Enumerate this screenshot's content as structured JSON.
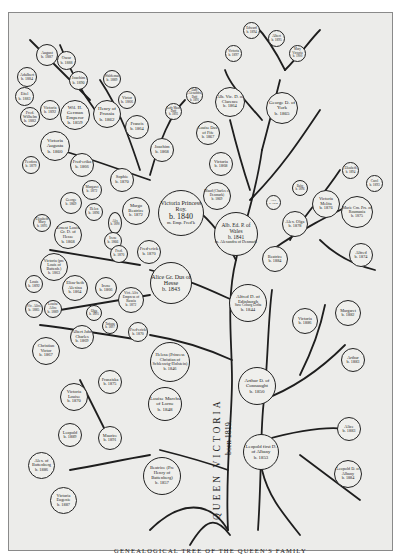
{
  "title": "Genealogical Tree of the Queen's Family",
  "caption": "GENEALOGICAL TREE OF THE QUEEN'S FAMILY",
  "trunk": {
    "line1": "QUEEN VICTORIA",
    "line2": "born 1819."
  },
  "colors": {
    "paper": "#ececea",
    "ink": "#1d1d1d",
    "border": "#8a8a8a"
  },
  "nodes": [
    {
      "id": "august",
      "name": "August",
      "birth": "b. 1887"
    },
    {
      "id": "oscar",
      "name": "Oscar",
      "birth": "b. 1888"
    },
    {
      "id": "adalbert",
      "name": "Adalbert",
      "birth": "b. 1884"
    },
    {
      "id": "joachim-small",
      "name": "Joachim",
      "birth": "b. 1890"
    },
    {
      "id": "eitel",
      "name": "Eitel",
      "birth": "b. 1883"
    },
    {
      "id": "fred-wilhelm",
      "name": "Fred. Wilhelm",
      "birth": "b. 1882"
    },
    {
      "id": "victoria-small",
      "name": "Victoria",
      "birth": "b. 1892"
    },
    {
      "id": "wilhelm",
      "name": "Wil. II. German Emperor",
      "birth": "b. 1859"
    },
    {
      "id": "waldemar",
      "name": "Waldemar",
      "birth": "b. 1889"
    },
    {
      "id": "henry",
      "name": "Henry of Prussia",
      "birth": "b. 1862"
    },
    {
      "id": "victor",
      "name": "Victor",
      "birth": "b. 1866"
    },
    {
      "id": "francis",
      "name": "Francis",
      "birth": "b. 1864"
    },
    {
      "id": "victoria-augusta",
      "name": "Victoria Augusta",
      "birth": "b. 1860"
    },
    {
      "id": "feodora",
      "name": "Feodora",
      "birth": "b. 1879"
    },
    {
      "id": "frederika",
      "name": "Fred-erika",
      "birth": "b. 1866"
    },
    {
      "id": "joachim",
      "name": "Joachim",
      "birth": "b. 1868"
    },
    {
      "id": "sophie",
      "name": "Sophie",
      "birth": "b. 1870"
    },
    {
      "id": "margaret-small",
      "name": "Margaret",
      "birth": "b. 1872"
    },
    {
      "id": "george-small",
      "name": "George",
      "birth": "b. 1869"
    },
    {
      "id": "helen",
      "name": "Helen",
      "birth": "b. 1896"
    },
    {
      "id": "margo-beatrice",
      "name": "Margo Beatrice",
      "birth": "b. 1872"
    },
    {
      "id": "victoria-princess-royal",
      "name": "Victoria Princess Roy.",
      "birth": "b. 1840",
      "note": "m. Emp. Fred'k"
    },
    {
      "id": "alix-small",
      "name": "Alix",
      "birth": "b. 1890"
    },
    {
      "id": "elizabeth-mary",
      "name": "Elizabeth Mary",
      "birth": "b. 1895"
    },
    {
      "id": "ernest-louis",
      "name": "Ernest Louis",
      "birth": "b. 1868",
      "note": "Gr. D. of Hesse"
    },
    {
      "id": "irene-small",
      "name": "Irene",
      "birth": "b. 1866"
    },
    {
      "id": "fred-small",
      "name": "Fred.",
      "birth": "b. 1870"
    },
    {
      "id": "frederick",
      "name": "Fred-erick",
      "birth": "b. 1870"
    },
    {
      "id": "victoria-battenberg",
      "name": "Victoria (pre Louis of Battenb.)",
      "birth": "b. 1863"
    },
    {
      "id": "louis",
      "name": "Louis",
      "birth": "b. 1892"
    },
    {
      "id": "elizabeth",
      "name": "Eliza-beth Alexina",
      "birth": "b. 1864"
    },
    {
      "id": "irene",
      "name": "Irene",
      "birth": "b. 1866"
    },
    {
      "id": "alice",
      "name": "Alice Gr. Dus of Hesse",
      "birth": "b. 1843"
    },
    {
      "id": "vic-alice",
      "name": "Vic. Alice",
      "birth": "b. 1885"
    },
    {
      "id": "louise-alice",
      "name": "Louise Alice",
      "birth": "b. 1889"
    },
    {
      "id": "alix",
      "name": "Vict. Alix Empress of Russia",
      "birth": "b. 1872"
    },
    {
      "id": "olga",
      "name": "Olga",
      "birth": "b. 1895"
    },
    {
      "id": "tatiana",
      "name": "Tatiana",
      "birth": "b. 1897"
    },
    {
      "id": "albert-john",
      "name": "Albert John Charles",
      "birth": "b. 1869"
    },
    {
      "id": "frederick-2",
      "name": "Fred-erick",
      "birth": "b. 1870"
    },
    {
      "id": "christian-victor",
      "name": "Christian Victor",
      "birth": "b. 1867"
    },
    {
      "id": "helena",
      "name": "Helena (Princess Christian of Schleswig-Holstein)",
      "birth": "b. 1846"
    },
    {
      "id": "victoria-louise",
      "name": "Victoria Louise",
      "birth": "b. 1870"
    },
    {
      "id": "franziska",
      "name": "Franziska",
      "birth": "b. 1875"
    },
    {
      "id": "louise",
      "name": "Louise Marchs of Lorne",
      "birth": "b. 1848"
    },
    {
      "id": "leopold-b",
      "name": "Leopold",
      "birth": "b. 1889"
    },
    {
      "id": "maurice",
      "name": "Maurice",
      "birth": "b. 1891"
    },
    {
      "id": "alex-battenberg",
      "name": "Alex. of Battenberg",
      "birth": "b. 1886"
    },
    {
      "id": "beatrice",
      "name": "Beatrice (Pre Henry of Battenberg)",
      "birth": "b. 1857"
    },
    {
      "id": "victoria-eugenie",
      "name": "Victoria Eugenie",
      "birth": "b. 1887"
    },
    {
      "id": "edward",
      "name": "Edward",
      "birth": "b. 1894"
    },
    {
      "id": "albert",
      "name": "Albert",
      "birth": "b. 1895"
    },
    {
      "id": "mary-small",
      "name": "Victoria",
      "birth": "b. 1897"
    },
    {
      "id": "albert-victor-child",
      "name": "Mary Victoria",
      "birth": "b. 1900"
    },
    {
      "id": "alb-vic",
      "name": "Alb. Vic. D. of Clarence",
      "birth": "b. 1864"
    },
    {
      "id": "george",
      "name": "George D. of York",
      "birth": "b. 1865"
    },
    {
      "id": "lady-alexandra",
      "name": "Lady Alexandra Duff",
      "birth": "b. 1891"
    },
    {
      "id": "lady-maud",
      "name": "Lady Maud Duff",
      "birth": "b. 1893"
    },
    {
      "id": "louise-fife",
      "name": "Louise Dus. of Fife",
      "birth": "b. 1867"
    },
    {
      "id": "victoria-wales",
      "name": "Victoria",
      "birth": "b. 1868"
    },
    {
      "id": "maud",
      "name": "Maud (Charles of Denmark)",
      "birth": "b. 1869"
    },
    {
      "id": "alb-ed",
      "name": "Alb. Ed. P. of Wales",
      "birth": "b. 1841",
      "note": "m. Alexandra of Denmark"
    },
    {
      "id": "alex-small",
      "name": "Alex.",
      "birth": "b. 1874"
    },
    {
      "id": "baby",
      "name": "Baby",
      "birth": "b. 1896"
    },
    {
      "id": "victoria-melita",
      "name": "Victoria Melita",
      "birth": "b. 1876"
    },
    {
      "id": "elizabeth-small",
      "name": "Elizabeth",
      "birth": "b. 1894"
    },
    {
      "id": "carol",
      "name": "Carol",
      "birth": "b. 1893"
    },
    {
      "id": "marie",
      "name": "Marie Crn. Prs. of Roumania",
      "birth": "b. 1875"
    },
    {
      "id": "alex-olga",
      "name": "Alex. Olga",
      "birth": "b. 1878"
    },
    {
      "id": "beatrice-e",
      "name": "Beatrice",
      "birth": "b. 1884"
    },
    {
      "id": "alfred-small",
      "name": "Alfred",
      "birth": "b. 1874"
    },
    {
      "id": "alfred",
      "name": "Alfred D. of Edinburgh",
      "birth": "b. 1844",
      "note": "Saxe Coburg Gotha"
    },
    {
      "id": "victoria-c",
      "name": "Victoria",
      "birth": "b. 1886"
    },
    {
      "id": "margaret",
      "name": "Margaret",
      "birth": "b. 1882"
    },
    {
      "id": "arthur-small",
      "name": "Arthur",
      "birth": "b. 1883"
    },
    {
      "id": "arthur",
      "name": "Arthur D. of Connaught",
      "birth": "b. 1850"
    },
    {
      "id": "alice-albany",
      "name": "Alice",
      "birth": "b. 1883"
    },
    {
      "id": "leopold",
      "name": "Leopold first D. of Albany",
      "birth": "b. 1853"
    },
    {
      "id": "leopold-albany",
      "name": "Leopold D. of Albany",
      "birth": "b. 1884"
    }
  ]
}
